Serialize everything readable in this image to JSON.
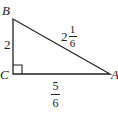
{
  "diagram": {
    "type": "right-triangle",
    "vertices": {
      "B": {
        "label": "B",
        "x": 13,
        "y": 19
      },
      "C": {
        "label": "C",
        "x": 13,
        "y": 74
      },
      "A": {
        "label": "A",
        "x": 110,
        "y": 74
      }
    },
    "right_angle_at": "C",
    "sides": {
      "BC": {
        "label": "2"
      },
      "AB": {
        "whole": "2",
        "numerator": "1",
        "denominator": "6"
      },
      "CA": {
        "numerator": "5",
        "denominator": "6"
      }
    },
    "colors": {
      "stroke": "#222222",
      "background": "#ffffff"
    }
  }
}
